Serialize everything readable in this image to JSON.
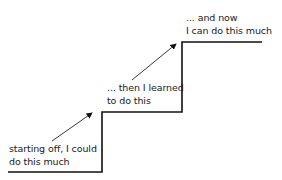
{
  "diagram": {
    "steps": [
      {
        "label_line1": "starting off, I could",
        "label_line2": "do this much"
      },
      {
        "label_line1": "... then I learned",
        "label_line2": "to do this"
      },
      {
        "label_line1": "... and now",
        "label_line2": "I can do this much"
      }
    ],
    "line_color": "#111111"
  }
}
